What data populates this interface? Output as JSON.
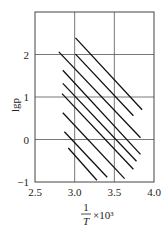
{
  "chart_data": {
    "type": "line",
    "title": "",
    "xlabel": "1/T × 10³",
    "xlabel_parts": {
      "numerator": "1",
      "denominator": "T",
      "suffix": "×10³"
    },
    "ylabel": "lgp",
    "xlim": [
      2.5,
      4.0
    ],
    "ylim": [
      -1,
      3
    ],
    "xticks": [
      2.5,
      3.0,
      3.5,
      4.0
    ],
    "xtick_labels": [
      "2.5",
      "3.0",
      "3.5",
      "4.0"
    ],
    "yticks": [
      -1,
      0,
      1,
      2
    ],
    "ytick_labels": [
      "−1",
      "0",
      "1",
      "2"
    ],
    "grid": true,
    "legend": null,
    "series": [
      {
        "name": "line-1",
        "x": [
          3.01,
          3.85
        ],
        "y": [
          2.39,
          0.7
        ]
      },
      {
        "name": "line-2",
        "x": [
          3.01,
          3.74
        ],
        "y": [
          2.01,
          0.56
        ]
      },
      {
        "name": "line-3",
        "x": [
          2.8,
          3.83
        ],
        "y": [
          2.06,
          0.04
        ]
      },
      {
        "name": "line-4",
        "x": [
          2.85,
          3.83
        ],
        "y": [
          1.63,
          -0.35
        ]
      },
      {
        "name": "line-5",
        "x": [
          2.85,
          3.78
        ],
        "y": [
          1.32,
          -0.51
        ]
      },
      {
        "name": "line-6",
        "x": [
          2.84,
          3.74
        ],
        "y": [
          1.08,
          -0.7
        ]
      },
      {
        "name": "line-7",
        "x": [
          2.85,
          3.63
        ],
        "y": [
          0.63,
          -0.92
        ]
      },
      {
        "name": "line-8",
        "x": [
          2.87,
          3.41
        ],
        "y": [
          0.18,
          -0.89
        ]
      },
      {
        "name": "line-9",
        "x": [
          2.92,
          3.28
        ],
        "y": [
          -0.2,
          -0.96
        ]
      }
    ],
    "colors": {
      "line": "#111111",
      "grid": "#555555",
      "frame": "#444444"
    }
  }
}
